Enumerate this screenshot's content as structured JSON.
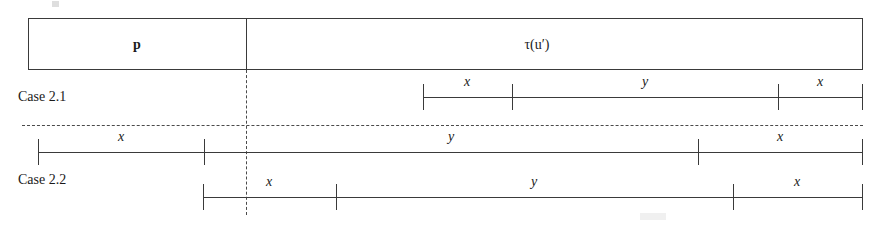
{
  "figure": {
    "top_box": {
      "left_cell_label": "p",
      "right_cell_label": "τ(u′)",
      "divider_x": 246
    },
    "cases": [
      {
        "id": "case-2-1",
        "caption": "Case 2.1",
        "segments": [
          {
            "label": "x"
          },
          {
            "label": "y"
          },
          {
            "label": "x"
          }
        ]
      },
      {
        "id": "case-2-2",
        "caption": "Case 2.2",
        "rows": [
          {
            "segments": [
              {
                "label": "x"
              },
              {
                "label": "y"
              },
              {
                "label": "x"
              }
            ]
          },
          {
            "segments": [
              {
                "label": "x"
              },
              {
                "label": "y"
              },
              {
                "label": "x"
              }
            ]
          }
        ]
      }
    ],
    "colors": {
      "ink": "#3a3a3a",
      "text": "#1a1a1a",
      "background": "#ffffff"
    }
  }
}
